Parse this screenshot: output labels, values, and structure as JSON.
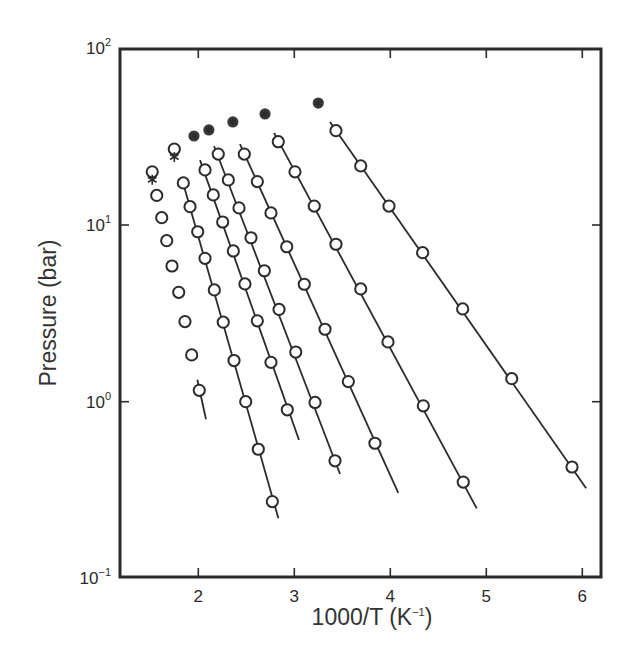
{
  "chart_data": {
    "type": "scatter",
    "title": "",
    "xlabel": "1000/T (K⁻¹)",
    "ylabel": "Pressure (bar)",
    "xscale": "linear",
    "yscale": "log",
    "xlim": [
      1.18,
      6.2
    ],
    "ylim": [
      0.1,
      100
    ],
    "x_ticks": [
      2,
      3,
      4,
      5,
      6
    ],
    "x_tick_labels": [
      "2",
      "3",
      "4",
      "5",
      "6"
    ],
    "y_ticks": [
      0.1,
      1,
      10,
      100
    ],
    "y_tick_labels": [
      {
        "base": "10",
        "exp": "−1"
      },
      {
        "base": "10",
        "exp": "0"
      },
      {
        "base": "10",
        "exp": "1"
      },
      {
        "base": "10",
        "exp": "2"
      }
    ],
    "grid": false,
    "legend": null,
    "critical_points": {
      "name": "critical points (circle with asterisk)",
      "x": [
        1.52,
        1.75,
        1.955,
        2.11,
        2.36,
        2.695,
        3.25
      ],
      "y": [
        20.0,
        26.9,
        31.9,
        34.5,
        38.3,
        42.5,
        49.0
      ]
    },
    "series": [
      {
        "name": "series 1",
        "x": [
          1.567,
          1.619,
          1.671,
          1.726,
          1.796,
          1.861,
          1.931,
          2.01
        ],
        "y": [
          14.7,
          11.0,
          8.15,
          5.86,
          4.16,
          2.84,
          1.84,
          1.16
        ],
        "fit_line": {
          "x": [
            1.99,
            2.08
          ],
          "y": [
            1.33,
            0.795
          ]
        }
      },
      {
        "name": "series 2",
        "x": [
          1.844,
          1.914,
          1.994,
          2.07,
          2.167,
          2.26,
          2.372,
          2.494,
          2.625,
          2.771
        ],
        "y": [
          17.3,
          12.7,
          9.16,
          6.48,
          4.29,
          2.82,
          1.71,
          1.0,
          0.538,
          0.272
        ],
        "fit_line": {
          "x": [
            1.84,
            2.834
          ],
          "y": [
            17.4,
            0.219
          ]
        }
      },
      {
        "name": "series 3",
        "x": [
          2.07,
          2.156,
          2.254,
          2.365,
          2.486,
          2.615,
          2.757,
          2.927
        ],
        "y": [
          20.5,
          14.8,
          10.4,
          7.13,
          4.64,
          2.87,
          1.67,
          0.9
        ],
        "fit_line": {
          "x": [
            2.018,
            3.049
          ],
          "y": [
            23.3,
            0.607
          ]
        }
      },
      {
        "name": "series 4",
        "x": [
          2.208,
          2.313,
          2.424,
          2.549,
          2.688,
          2.841,
          3.015,
          3.216,
          3.424
        ],
        "y": [
          25.2,
          18.0,
          12.5,
          8.47,
          5.51,
          3.33,
          1.91,
          0.99,
          0.463
        ],
        "fit_line": {
          "x": [
            2.164,
            3.476
          ],
          "y": [
            28.0,
            0.39
          ]
        }
      },
      {
        "name": "series 5",
        "x": [
          2.479,
          2.615,
          2.757,
          2.921,
          3.104,
          3.32,
          3.563,
          3.84
        ],
        "y": [
          25.2,
          17.6,
          11.7,
          7.53,
          4.62,
          2.57,
          1.3,
          0.582
        ],
        "fit_line": {
          "x": [
            2.434,
            4.083
          ],
          "y": [
            28.7,
            0.305
          ]
        }
      },
      {
        "name": "series 6",
        "x": [
          2.833,
          3.007,
          3.208,
          3.434,
          3.692,
          3.976,
          4.344,
          4.76
        ],
        "y": [
          29.6,
          20.0,
          12.8,
          7.78,
          4.35,
          2.18,
          0.948,
          0.351
        ],
        "fit_line": {
          "x": [
            2.789,
            4.9
          ],
          "y": [
            33.2,
            0.249
          ]
        }
      },
      {
        "name": "series 7",
        "x": [
          3.434,
          3.692,
          3.986,
          4.337,
          4.754,
          5.265,
          5.893
        ],
        "y": [
          34.2,
          21.6,
          12.8,
          6.97,
          3.35,
          1.35,
          0.427
        ],
        "fit_line": {
          "x": [
            3.372,
            6.04
          ],
          "y": [
            38.3,
            0.324
          ]
        }
      }
    ]
  },
  "axes": {
    "x_title": "1000/T (K⁻¹)",
    "x_title_main": "1000/T (K",
    "x_title_sup": "−1",
    "x_title_end": ")",
    "y_title": "Pressure (bar)"
  },
  "layout": {
    "plot": {
      "left": 120,
      "top": 49,
      "right": 601,
      "bottom": 577
    },
    "x_px_at_2": 198.3,
    "x_px_per_unit": 96,
    "y_px_at_10": 225,
    "y_px_per_decade": 176.7
  }
}
